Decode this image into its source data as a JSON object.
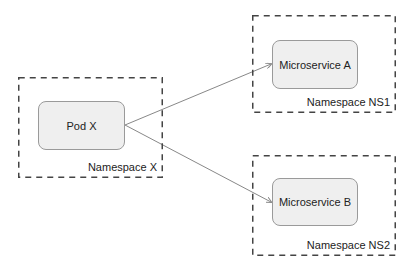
{
  "diagram": {
    "namespaces": [
      {
        "id": "nsx",
        "label": "Namespace X",
        "x": 18,
        "y": 77,
        "w": 145,
        "h": 101
      },
      {
        "id": "ns1",
        "label": "Namespace NS1",
        "x": 252,
        "y": 15,
        "w": 144,
        "h": 98
      },
      {
        "id": "ns2",
        "label": "Namespace NS2",
        "x": 252,
        "y": 155,
        "w": 144,
        "h": 101
      }
    ],
    "nodes": [
      {
        "id": "podx",
        "label": "Pod X",
        "x": 38,
        "y": 101,
        "w": 87,
        "h": 49
      },
      {
        "id": "msa",
        "label": "Microservice A",
        "x": 272,
        "y": 40,
        "w": 86,
        "h": 49
      },
      {
        "id": "msb",
        "label": "Microservice B",
        "x": 272,
        "y": 178,
        "w": 86,
        "h": 48
      }
    ],
    "edges": [
      {
        "from": "Pod X",
        "to": "Microservice A",
        "x1": 125,
        "y1": 125,
        "x2": 271,
        "y2": 64
      },
      {
        "from": "Pod X",
        "to": "Microservice B",
        "x1": 125,
        "y1": 125,
        "x2": 271,
        "y2": 202
      }
    ],
    "colors": {
      "node_fill": "#efefef",
      "node_border": "#9a9a9a",
      "dash": "#444444",
      "edge": "#888888"
    }
  }
}
